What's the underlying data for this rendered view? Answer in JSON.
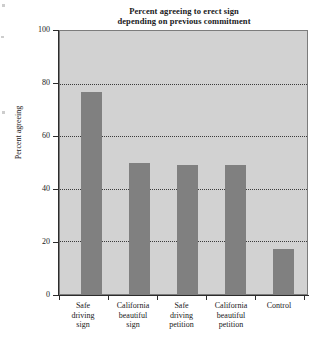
{
  "chart_data": {
    "type": "bar",
    "title": "Percent agreeing to erect sign depending on previous commitment",
    "title_lines": [
      "Percent agreeing to erect sign",
      "depending on previous commitment"
    ],
    "xlabel": "",
    "ylabel": "Percent agreeing",
    "categories": [
      "Safe driving sign",
      "California beautiful sign",
      "Safe driving petition",
      "California beautiful petition",
      "Control"
    ],
    "category_lines": [
      [
        "Safe",
        "driving",
        "sign"
      ],
      [
        "California",
        "beautiful",
        "sign"
      ],
      [
        "Safe",
        "driving",
        "petition"
      ],
      [
        "California",
        "beautiful",
        "petition"
      ],
      [
        "Control"
      ]
    ],
    "values": [
      77,
      50,
      49,
      49,
      17
    ],
    "ylim": [
      0,
      100
    ],
    "yticks": [
      0,
      20,
      40,
      60,
      80,
      100
    ],
    "ytick_labels": [
      "0",
      "20",
      "40",
      "60",
      "80",
      "100"
    ],
    "grid": true,
    "grid_axis": "y",
    "legend": "none",
    "colors": {
      "bar": "#808080",
      "plot_background": "#d2d2d2",
      "page_background": "#ffffff",
      "axis": "#2c2c2c",
      "gridline": "#3b3b3b",
      "text": "#19191b"
    }
  }
}
